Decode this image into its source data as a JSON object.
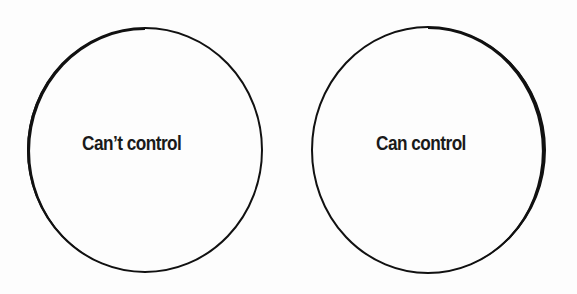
{
  "diagram": {
    "type": "two-circles",
    "circles": [
      {
        "id": "left",
        "label": "Can’t control",
        "center": [
          145,
          150
        ],
        "radius": [
          118,
          122
        ],
        "stroke_color": "#111111"
      },
      {
        "id": "right",
        "label": "Can control",
        "center": [
          428,
          150
        ],
        "radius": [
          117,
          123
        ],
        "stroke_color": "#111111"
      }
    ],
    "background_color": "#ffffff"
  }
}
